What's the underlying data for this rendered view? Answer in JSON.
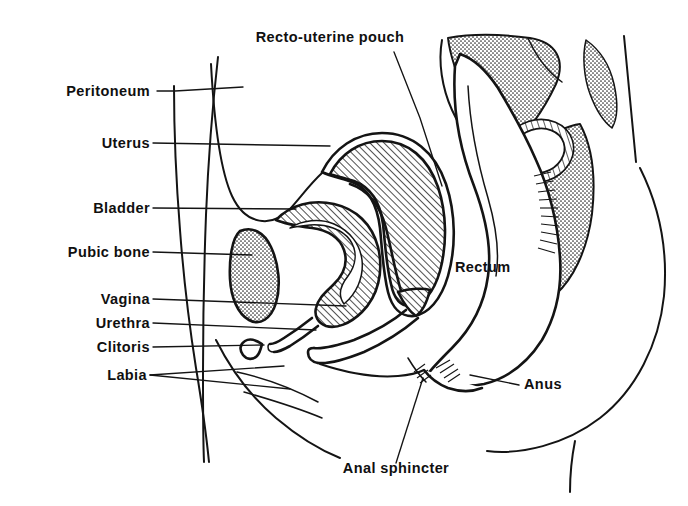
{
  "figure": {
    "background_color": "#ffffff",
    "ink_color": "#141414"
  },
  "labels": {
    "recto_uterine_pouch": "Recto-uterine pouch",
    "peritoneum": "Peritoneum",
    "uterus": "Uterus",
    "bladder": "Bladder",
    "pubic_bone": "Pubic bone",
    "vagina": "Vagina",
    "urethra": "Urethra",
    "clitoris": "Clitoris",
    "labia": "Labia",
    "rectum": "Rectum",
    "anus": "Anus",
    "anal_sphincter": "Anal sphincter"
  },
  "label_list": [
    {
      "key": "recto_uterine_pouch",
      "text": "Recto-uterine pouch",
      "side": "top",
      "x": 330,
      "y": 42
    },
    {
      "key": "peritoneum",
      "text": "Peritoneum",
      "side": "left",
      "x": 150,
      "y": 96
    },
    {
      "key": "uterus",
      "text": "Uterus",
      "side": "left",
      "x": 150,
      "y": 148
    },
    {
      "key": "bladder",
      "text": "Bladder",
      "side": "left",
      "x": 150,
      "y": 212
    },
    {
      "key": "pubic_bone",
      "text": "Pubic bone",
      "side": "left",
      "x": 150,
      "y": 256
    },
    {
      "key": "vagina",
      "text": "Vagina",
      "side": "left",
      "x": 150,
      "y": 303
    },
    {
      "key": "urethra",
      "text": "Urethra",
      "side": "left",
      "x": 150,
      "y": 327
    },
    {
      "key": "clitoris",
      "text": "Clitoris",
      "side": "left",
      "x": 150,
      "y": 351
    },
    {
      "key": "labia",
      "text": "Labia",
      "side": "left",
      "x": 150,
      "y": 379
    },
    {
      "key": "rectum",
      "text": "Rectum",
      "side": "inner",
      "x": 455,
      "y": 272
    },
    {
      "key": "anus",
      "text": "Anus",
      "side": "right",
      "x": 521,
      "y": 389
    },
    {
      "key": "anal_sphincter",
      "text": "Anal sphincter",
      "side": "bottom",
      "x": 328,
      "y": 473
    }
  ],
  "structures": [
    {
      "name": "uterus",
      "shading": "hatch"
    },
    {
      "name": "bladder-wall",
      "shading": "hatch"
    },
    {
      "name": "pubic-bone",
      "shading": "stipple"
    },
    {
      "name": "sacrum",
      "shading": "stipple"
    },
    {
      "name": "rectum",
      "shading": "none"
    },
    {
      "name": "vagina",
      "shading": "none"
    },
    {
      "name": "body-outline",
      "shading": "none"
    }
  ]
}
